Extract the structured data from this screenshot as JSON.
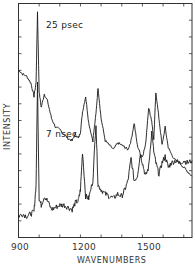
{
  "chart_data": {
    "type": "line",
    "title": "",
    "xlabel": "WAVENUMBERS",
    "ylabel": "INTENSITY",
    "xlim": [
      900,
      1740
    ],
    "x_ticks": [
      900,
      1200,
      1500
    ],
    "x_minor_ticks": [
      1000,
      1100,
      1300,
      1400,
      1600,
      1700
    ],
    "grid": false,
    "legend": null,
    "annotations": [
      "25 psec",
      "7 nsec"
    ],
    "series": [
      {
        "name": "25 psec",
        "x": [
          900,
          920,
          940,
          960,
          975,
          985,
          992,
          1000,
          1010,
          1025,
          1040,
          1060,
          1080,
          1100,
          1120,
          1140,
          1160,
          1175,
          1190,
          1200,
          1210,
          1225,
          1240,
          1260,
          1275,
          1285,
          1300,
          1320,
          1340,
          1360,
          1380,
          1400,
          1415,
          1430,
          1445,
          1460,
          1475,
          1490,
          1500,
          1515,
          1530,
          1545,
          1555,
          1565,
          1580,
          1595,
          1610,
          1625,
          1640,
          1660,
          1680,
          1700,
          1720,
          1740
        ],
        "y": [
          0.72,
          0.7,
          0.69,
          0.66,
          0.6,
          0.66,
          0.98,
          0.62,
          0.55,
          0.61,
          0.58,
          0.5,
          0.46,
          0.45,
          0.43,
          0.41,
          0.4,
          0.43,
          0.41,
          0.44,
          0.53,
          0.6,
          0.48,
          0.4,
          0.52,
          0.64,
          0.5,
          0.4,
          0.38,
          0.36,
          0.39,
          0.38,
          0.37,
          0.36,
          0.4,
          0.48,
          0.38,
          0.34,
          0.33,
          0.38,
          0.55,
          0.49,
          0.4,
          0.62,
          0.5,
          0.38,
          0.46,
          0.37,
          0.34,
          0.31,
          0.3,
          0.28,
          0.26,
          0.24
        ]
      },
      {
        "name": "7 nsec",
        "x": [
          900,
          920,
          940,
          960,
          975,
          985,
          992,
          1000,
          1010,
          1025,
          1040,
          1060,
          1080,
          1100,
          1120,
          1140,
          1160,
          1175,
          1190,
          1200,
          1210,
          1225,
          1240,
          1260,
          1275,
          1285,
          1300,
          1320,
          1340,
          1360,
          1380,
          1400,
          1415,
          1430,
          1445,
          1460,
          1475,
          1490,
          1500,
          1515,
          1530,
          1545,
          1555,
          1565,
          1580,
          1595,
          1610,
          1625,
          1640,
          1660,
          1680,
          1700,
          1720,
          1740
        ],
        "y": [
          0.06,
          0.07,
          0.06,
          0.07,
          0.08,
          0.2,
          0.66,
          0.14,
          0.11,
          0.15,
          0.13,
          0.09,
          0.1,
          0.11,
          0.11,
          0.1,
          0.09,
          0.12,
          0.13,
          0.18,
          0.35,
          0.15,
          0.14,
          0.22,
          0.48,
          0.2,
          0.18,
          0.16,
          0.15,
          0.14,
          0.16,
          0.15,
          0.18,
          0.22,
          0.32,
          0.22,
          0.24,
          0.34,
          0.3,
          0.24,
          0.28,
          0.44,
          0.35,
          0.3,
          0.25,
          0.3,
          0.33,
          0.28,
          0.3,
          0.31,
          0.3,
          0.31,
          0.3,
          0.31
        ]
      }
    ]
  },
  "labels": {
    "x_tick_900": "900",
    "x_tick_1200": "1200",
    "x_tick_1500": "1500",
    "xlabel": "WAVENUMBERS",
    "ylabel": "INTENSITY",
    "annot_top": "25 psec",
    "annot_bottom": "7 nsec"
  }
}
